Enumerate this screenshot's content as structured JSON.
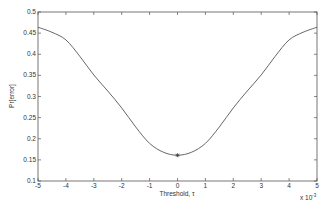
{
  "chart_data": {
    "type": "line",
    "title": "",
    "xlabel": "Threshold, τ",
    "ylabel": "Pr[error]",
    "x_exponent_label": "x 10",
    "x_exponent": "-3",
    "xlim": [
      -5,
      5
    ],
    "ylim": [
      0.1,
      0.5
    ],
    "grid": false,
    "legend": null,
    "xticks": [
      "-5",
      "-4",
      "-3",
      "-2",
      "-1",
      "0",
      "1",
      "2",
      "3",
      "4",
      "5"
    ],
    "yticks": [
      "0.1",
      "0.15",
      "0.2",
      "0.25",
      "0.3",
      "0.35",
      "0.4",
      "0.45",
      "0.5"
    ],
    "series": [
      {
        "name": "Pr[error]",
        "color": "#555555",
        "x": [
          -5,
          -4.5,
          -4,
          -3.5,
          -3,
          -2.5,
          -2,
          -1.5,
          -1,
          -0.5,
          0,
          0.5,
          1,
          1.5,
          2,
          2.5,
          3,
          3.5,
          4,
          4.5,
          5
        ],
        "y": [
          0.464,
          0.452,
          0.434,
          0.395,
          0.351,
          0.313,
          0.273,
          0.228,
          0.189,
          0.168,
          0.161,
          0.168,
          0.189,
          0.228,
          0.273,
          0.313,
          0.351,
          0.395,
          0.434,
          0.452,
          0.464
        ]
      }
    ],
    "markers": [
      {
        "x": 0,
        "y": 0.161,
        "symbol": "*",
        "label": "minimum"
      }
    ]
  }
}
